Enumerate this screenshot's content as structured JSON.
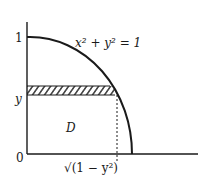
{
  "diagram": {
    "type": "region-integration-sketch",
    "labels": {
      "y_tick_top": "1",
      "y_tick_mid": "y",
      "origin": "0",
      "curve_equation": "x² + y² = 1",
      "region": "D",
      "x_tick": "√(1 − y²)"
    },
    "elements": {
      "axes": [
        "vertical y-axis",
        "horizontal x-axis"
      ],
      "curve": "quarter circle of unit radius in first quadrant",
      "strip": "hatched horizontal strip at height y from x = 0 to x = √(1 − y²)",
      "dashed_line": "vertical dashed drop from strip/curve intersection to x-axis"
    },
    "colors": {
      "stroke": "#1a1a1a",
      "background": "#ffffff"
    }
  }
}
